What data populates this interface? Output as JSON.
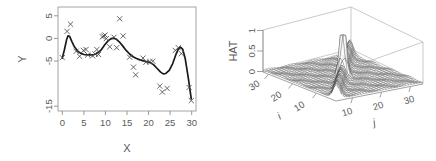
{
  "figure": {
    "background": "#ffffff",
    "panel_count": 2,
    "line_color": "#1a1a1a",
    "marker_color": "#4d4d4d",
    "axis_color": "#8d8d8d",
    "text_color": "#5a5a5a"
  },
  "chart_data": [
    {
      "type": "scatter",
      "id": "left-panel",
      "title": "",
      "xlabel": "X",
      "ylabel": "Y",
      "xlim": [
        0.0,
        32.0
      ],
      "ylim": [
        -17.0,
        6.0
      ],
      "xticks": [
        0,
        5,
        10,
        15,
        20,
        25,
        30
      ],
      "xtick_labels": [
        "0",
        "5",
        "10",
        "15",
        "20",
        "25",
        "30"
      ],
      "yticks": [
        5,
        0,
        -5,
        -15
      ],
      "ytick_labels": [
        "5",
        "0",
        "-5",
        "-15"
      ],
      "grid": false,
      "legend": null,
      "marker": "x",
      "series": [
        {
          "name": "observations",
          "type": "scatter",
          "marker": "x",
          "x": [
            1.0,
            2.1,
            2.9,
            4.2,
            5.0,
            5.9,
            6.5,
            6.9,
            8.0,
            8.6,
            9.0,
            9.4,
            10.3,
            10.6,
            10.9,
            11.2,
            12.0,
            13.0,
            13.6,
            14.3,
            15.1,
            16.6,
            17.5,
            18.0,
            19.7,
            20.4,
            21.3,
            22.0,
            23.6,
            24.2,
            25.3,
            27.2,
            27.9,
            28.6,
            30.4,
            30.9
          ],
          "y": [
            -5.2,
            0.6,
            2.2,
            -3.8,
            -4.9,
            -3.6,
            -3.4,
            -4.6,
            -4.8,
            -4.4,
            -3.4,
            -4.5,
            -0.6,
            -0.4,
            -0.2,
            -1.0,
            -2.8,
            -0.7,
            -3.0,
            3.4,
            -0.4,
            -5.1,
            -7.3,
            -9.0,
            -5.3,
            -6.2,
            -6.1,
            -6.0,
            -11.5,
            -12.8,
            -12.0,
            -3.6,
            -3.0,
            -4.3,
            -11.8,
            -14.7
          ]
        },
        {
          "name": "smooth-fit",
          "type": "line",
          "x": [
            1.0,
            1.5,
            2.0,
            2.3,
            2.7,
            3.2,
            3.8,
            4.5,
            5.2,
            6.0,
            6.8,
            7.6,
            8.4,
            9.2,
            10.0,
            10.8,
            11.6,
            12.3,
            12.9,
            13.5,
            14.2,
            15.0,
            15.8,
            16.6,
            17.4,
            18.2,
            19.0,
            19.8,
            20.6,
            21.4,
            22.2,
            23.0,
            23.8,
            24.4,
            25.0,
            25.8,
            26.6,
            27.3,
            27.9,
            28.4,
            28.9,
            29.5,
            30.2,
            30.9
          ],
          "y": [
            -5.3,
            -3.4,
            -1.2,
            -0.4,
            -0.5,
            -1.6,
            -2.8,
            -3.7,
            -4.2,
            -4.5,
            -4.6,
            -4.6,
            -4.5,
            -4.2,
            -3.5,
            -2.4,
            -1.5,
            -1.0,
            -0.9,
            -1.1,
            -1.7,
            -2.6,
            -3.6,
            -4.4,
            -5.0,
            -5.4,
            -5.7,
            -5.9,
            -6.1,
            -6.3,
            -6.8,
            -7.6,
            -8.4,
            -8.8,
            -8.7,
            -8.0,
            -6.5,
            -4.6,
            -3.3,
            -2.9,
            -3.3,
            -5.4,
            -9.6,
            -14.3
          ]
        }
      ]
    },
    {
      "type": "surface",
      "id": "right-panel",
      "title": "",
      "zlabel": "HAT",
      "xlabel": "i",
      "ylabel": "j",
      "zlim": [
        0.0,
        1.0
      ],
      "zticks": [
        0,
        0.5,
        1
      ],
      "ztick_labels": [
        "0",
        "0.5",
        "1"
      ],
      "xticks": [
        10,
        20,
        30
      ],
      "xtick_labels": [
        "10",
        "20",
        "30"
      ],
      "yticks": [
        10,
        20,
        30
      ],
      "ytick_labels": [
        "10",
        "20",
        "30"
      ],
      "grid": false,
      "legend": null,
      "description": "Wireframe perspective surface of hat-matrix diagonal values, near-zero plateau with a sharp narrow diagonal ridge and one tall spike reaching 1.0",
      "peak_value": 1.0,
      "plateau_value": 0.05,
      "mesh_n": 32
    }
  ]
}
